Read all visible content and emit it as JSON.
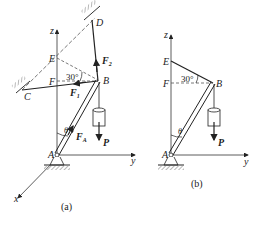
{
  "figure_a": {
    "caption": "(a)",
    "points": {
      "A": "A",
      "B": "B",
      "C": "C",
      "D": "D",
      "E": "E",
      "F": "F"
    },
    "axes": {
      "x": "x",
      "y": "y",
      "z": "z"
    },
    "angle_label": "30°",
    "theta": "θ",
    "forces": {
      "F1": "F",
      "F1_sub": "1",
      "F2": "F",
      "F2_sub": "2",
      "FA": "F",
      "FA_sub": "A",
      "P": "P"
    }
  },
  "figure_b": {
    "caption": "(b)",
    "points": {
      "A": "A",
      "B": "B",
      "E": "E",
      "F": "F"
    },
    "axes": {
      "y": "y",
      "z": "z"
    },
    "angle_label": "30°",
    "theta": "θ",
    "forces": {
      "P": "P"
    }
  },
  "colors": {
    "line": "#333333",
    "dashed": "#555555"
  }
}
